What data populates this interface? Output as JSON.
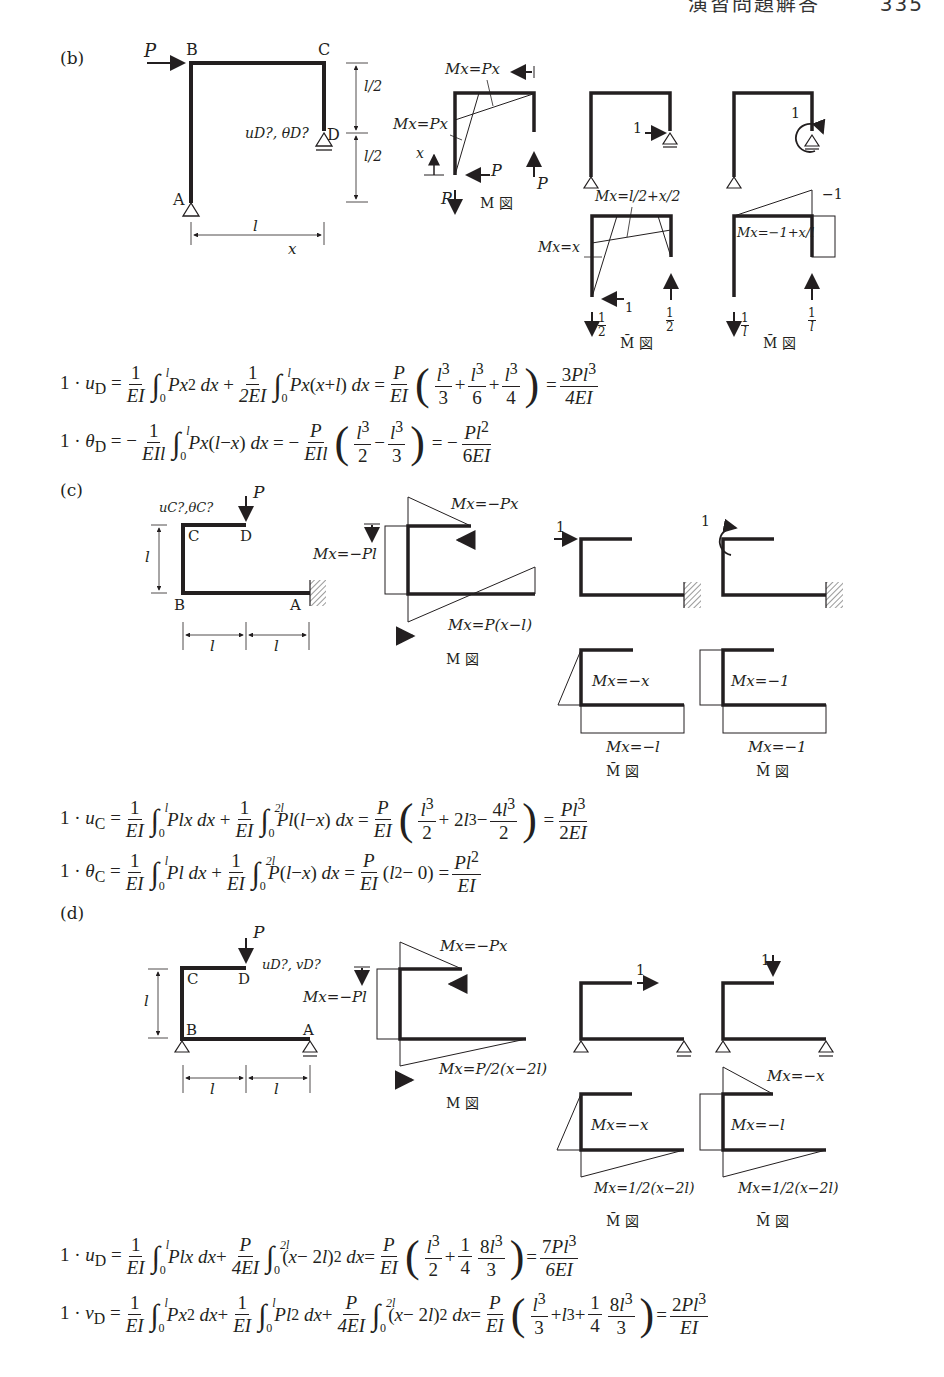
{
  "page": {
    "header_title": "演習問題解答",
    "page_number": "335"
  },
  "sections": {
    "b": {
      "label": "(b)",
      "structure": {
        "load": "P",
        "nodes": [
          "A",
          "B",
          "C",
          "D"
        ],
        "unknowns": "uD?, θD?",
        "dim_half_top": "l/2",
        "dim_half_bottom": "l/2",
        "dim_span": "l",
        "coord": "x"
      },
      "m_diagram": {
        "label_top": "Mx=Px",
        "label_left": "Mx=Px",
        "x_axis": "x",
        "reaction_h": "P",
        "reaction_v_left": "P",
        "reaction_v_right": "P",
        "title": "M 図"
      },
      "unit_load_1": {
        "load": "1"
      },
      "unit_load_2": {
        "load": "1"
      },
      "mbar_1": {
        "label_top": "Mx=l/2+x/2",
        "label_left": "Mx=x",
        "reaction_h": "1",
        "reaction_left_num": "1",
        "reaction_left_den": "2",
        "reaction_right_num": "1",
        "reaction_right_den": "2",
        "title": "M̄ 図"
      },
      "mbar_2": {
        "label_corner": "−1",
        "label_mid": "Mx=−1+x/l",
        "reaction_left_num": "1",
        "reaction_left_den": "l",
        "reaction_right_num": "1",
        "reaction_right_den": "l",
        "title": "M̄ 図"
      },
      "equations": [
        "1·uD = 1/EI ∫₀ˡ Px² dx + 1/2EI ∫₀ˡ Px(x+l) dx = P/EI (l³/3 + l³/6 + l³/4) = 3Pl³/4EI",
        "1·θD = −1/EIl ∫₀ˡ Px(l−x) dx = −P/EIl (l³/2 − l³/3) = −Pl²/6EI"
      ]
    },
    "c": {
      "label": "(c)",
      "structure": {
        "load": "P",
        "nodes": [
          "A",
          "B",
          "C",
          "D"
        ],
        "unknowns": "uC?,θC?",
        "dim_height": "l",
        "dim_span_1": "l",
        "dim_span_2": "l"
      },
      "m_diagram": {
        "label_top": "Mx=−Px",
        "label_left": "Mx=−Pl",
        "label_bottom": "Mx=P(x−l)",
        "title": "M 図"
      },
      "unit_load_1": {
        "load": "1"
      },
      "unit_load_2": {
        "load": "1"
      },
      "mbar_1": {
        "label_mid": "Mx=−x",
        "label_bottom": "Mx=−l",
        "title": "M̄ 図"
      },
      "mbar_2": {
        "label_mid": "Mx=−1",
        "label_bottom": "Mx=−1",
        "title": "M̄ 図"
      },
      "equations": [
        "1·uC = 1/EI ∫₀ˡ Plx dx + 1/EI ∫₀²ˡ Pl(l−x) dx = P/EI (l³/2 + 2l³ − 4l³/2) = Pl³/2EI",
        "1·θC = 1/EI ∫₀ˡ Pl dx + 1/EI ∫₀²ˡ P(l−x) dx = P/EI (l² − 0) = Pl²/EI"
      ]
    },
    "d": {
      "label": "(d)",
      "structure": {
        "load": "P",
        "nodes": [
          "A",
          "B",
          "C",
          "D"
        ],
        "unknowns": "uD?, vD?",
        "dim_height": "l",
        "dim_span_1": "l",
        "dim_span_2": "l"
      },
      "m_diagram": {
        "label_top": "Mx=−Px",
        "label_left": "Mx=−Pl",
        "label_bottom": "Mx=P/2(x−2l)",
        "title": "M 図"
      },
      "unit_load_1": {
        "load": "1"
      },
      "unit_load_2": {
        "load": "1"
      },
      "mbar_1": {
        "label_mid": "Mx=−x",
        "label_bottom": "Mx=1/2(x−2l)",
        "title": "M̄ 図"
      },
      "mbar_2": {
        "label_top": "Mx=−x",
        "label_mid": "Mx=−l",
        "label_bottom": "Mx=1/2(x−2l)",
        "title": "M̄ 図"
      },
      "equations": [
        "1·uD = 1/EI ∫₀ˡ Plx dx + P/4EI ∫₀²ˡ (x−2l)² dx = P/EI (l³/2 + 1/4·8l³/3) = 7Pl³/6EI",
        "1·vD = 1/EI ∫₀ˡ Px² dx + 1/EI ∫₀ˡ Pl² dx + P/4EI ∫₀²ˡ (x−2l)² dx = P/EI (l³/3 + l³ + 1/4·8l³/3) = 2Pl³/EI"
      ]
    }
  },
  "sym": {
    "one": "1",
    "two": "2",
    "three": "3",
    "four": "4",
    "six": "6",
    "EI": "EI",
    "2EI": "2EI",
    "4EI": "4EI",
    "6EI": "6EI",
    "EIl": "EIl",
    "P": "P",
    "l": "l",
    "0": "0",
    "2l": "2l"
  }
}
